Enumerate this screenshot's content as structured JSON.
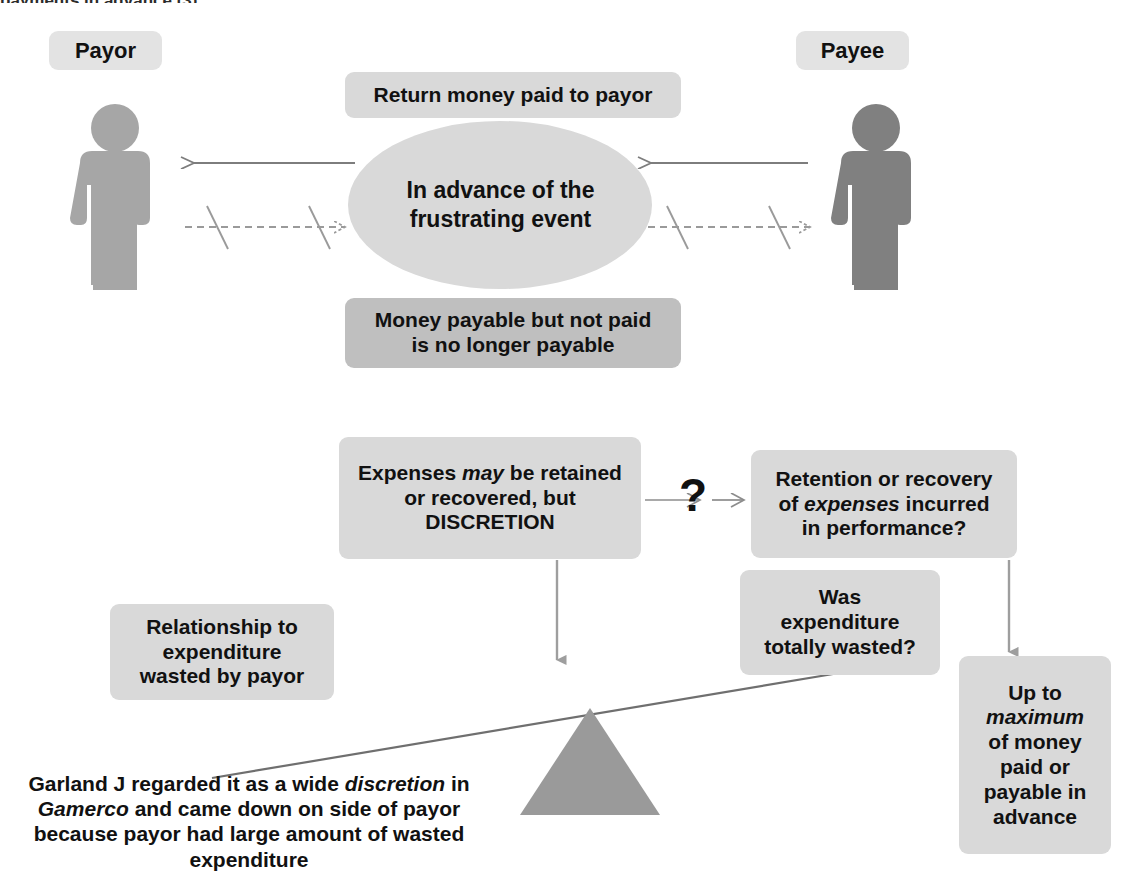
{
  "diagram": {
    "title_fragment": "payments in advance (3)",
    "actors": [
      {
        "label": "Payor",
        "figure": "person-icon",
        "color": "#a6a6a6"
      },
      {
        "label": "Payee",
        "figure": "person-icon",
        "color": "#808080"
      }
    ],
    "center_ellipse": {
      "line1": "In advance of the",
      "line2": "frustrating event",
      "color": "#d9d9d9"
    },
    "boxes": {
      "return_money": "Return money paid to payor",
      "no_longer_payable_line1": "Money payable but not paid",
      "no_longer_payable_line2": "is no longer payable",
      "expenses_discretion": {
        "line1_a": "Expenses ",
        "line1_i": "may",
        "line1_b": " be retained",
        "line2": "or recovered, but",
        "line3": "DISCRETION"
      },
      "retention_recovery": {
        "line1": "Retention or recovery",
        "line2_a": "of ",
        "line2_i": "expenses",
        "line2_b": " incurred",
        "line3": "in performance?"
      },
      "relationship_expenditure": {
        "line1": "Relationship to",
        "line2": "expenditure",
        "line3": "wasted by payor"
      },
      "was_expenditure_wasted": {
        "line1": "Was",
        "line2": "expenditure",
        "line3": "totally wasted?"
      },
      "up_to_maximum": {
        "line1": "Up to",
        "line2_i": "maximum",
        "line3": "of money",
        "line4": "paid or",
        "line5": "payable in",
        "line6": "advance"
      }
    },
    "question_marker": "?",
    "footnote": {
      "line1_a": "Garland J regarded it as a wide ",
      "line1_i": "discretion",
      "line1_b": " in",
      "line2_i": "Gamerco",
      "line2_b": " and came down on side of payor",
      "line3": "because payor had large amount of wasted",
      "line4": "expenditure"
    },
    "colors": {
      "box_light": "#d9d9d9",
      "box_dark": "#bfbfbf",
      "arrow_gray": "#8c8c8c",
      "line_gray": "#6f6f6f",
      "fulcrum": "#9a9a9a"
    }
  }
}
